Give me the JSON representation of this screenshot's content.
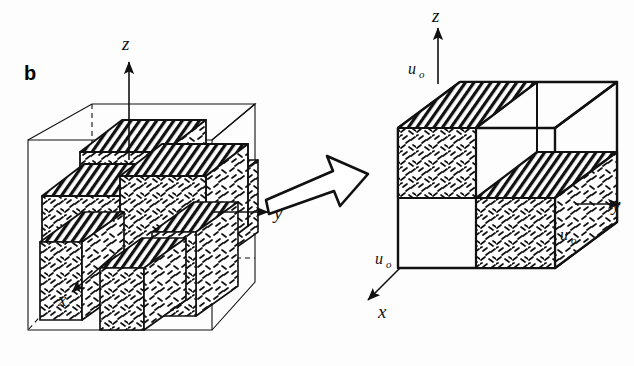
{
  "figure": {
    "panel_label": "b",
    "background": "#fdfdfd",
    "ink": "#111111"
  },
  "left_diagram": {
    "name": "periodic-cell-array",
    "axes": [
      {
        "id": "z",
        "label": "z",
        "direction": "up"
      },
      {
        "id": "y",
        "label": "y",
        "direction": "right"
      },
      {
        "id": "x",
        "label": "x",
        "direction": "down-left"
      }
    ],
    "outer_box": {
      "style": "thin-wireframe",
      "hidden_edges": "dashed"
    },
    "blocks": "2x2x2 checkerboard of textured sub-cells"
  },
  "transform_arrow": {
    "name": "transform-arrow",
    "direction": "right",
    "style": "hand-drawn-block-outline"
  },
  "right_diagram": {
    "name": "representative-cell",
    "axes": [
      {
        "id": "z",
        "label": "z",
        "direction": "up"
      },
      {
        "id": "y",
        "label": "y",
        "direction": "right"
      },
      {
        "id": "x",
        "label": "x",
        "direction": "down-left"
      }
    ],
    "boundary_labels": [
      {
        "id": "u0-top",
        "label": "u",
        "subscript": "o",
        "position": "top-left-edge"
      },
      {
        "id": "u0-right",
        "label": "u",
        "subscript": "o",
        "position": "bottom-right-edge"
      },
      {
        "id": "u0-left",
        "label": "u",
        "subscript": "o",
        "position": "bottom-left-edge"
      }
    ],
    "blocks": "checkerboard quarter-cell, two filled two empty"
  },
  "textures": {
    "top_face": "diagonal-hatch",
    "front_face": "dash-stipple",
    "side_face": "dash-stipple"
  }
}
